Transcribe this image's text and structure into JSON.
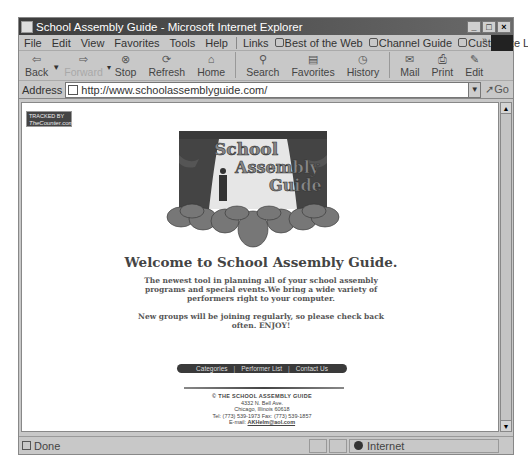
{
  "window": {
    "title": "School Assembly Guide - Microsoft Internet Explorer",
    "controls": [
      "_",
      "□",
      "×"
    ]
  },
  "menubar": {
    "items": [
      "File",
      "Edit",
      "View",
      "Favorites",
      "Tools",
      "Help"
    ],
    "links_label": "Links",
    "links": [
      "Best of the Web",
      "Channel Guide",
      "Customize Links"
    ]
  },
  "toolbar": {
    "buttons": [
      {
        "label": "Back",
        "icon": "⇦",
        "enabled": true
      },
      {
        "label": "Forward",
        "icon": "⇨",
        "enabled": false
      },
      {
        "label": "Stop",
        "icon": "⊗",
        "enabled": true
      },
      {
        "label": "Refresh",
        "icon": "⟳",
        "enabled": true
      },
      {
        "label": "Home",
        "icon": "⌂",
        "enabled": true
      },
      {
        "label": "Search",
        "icon": "⚲",
        "enabled": true
      },
      {
        "label": "Favorites",
        "icon": "▤",
        "enabled": true
      },
      {
        "label": "History",
        "icon": "◷",
        "enabled": true
      },
      {
        "label": "Mail",
        "icon": "✉",
        "enabled": true
      },
      {
        "label": "Print",
        "icon": "⎙",
        "enabled": true
      },
      {
        "label": "Edit",
        "icon": "✎",
        "enabled": true
      }
    ]
  },
  "address": {
    "label": "Address",
    "url": "http://www.schoolassemblyguide.com/",
    "go_label": "Go"
  },
  "page": {
    "tracked_badge": {
      "line1": "TRACKED BY",
      "line2": "TheCounter.com"
    },
    "logo": {
      "line1": "School",
      "line2": "Assembly",
      "line3": "Guide"
    },
    "welcome": "Welcome to School Assembly Guide.",
    "blurb": "The newest tool in planning all of your school assembly programs and special events.We bring a wide variety of performers right to your computer.",
    "blurb2": "New groups will be joining regularly, so please check back often. ENJOY!",
    "nav": [
      "Categories",
      "Performer List",
      "Contact Us"
    ],
    "nav_sep": "|",
    "footer": {
      "title": "© THE SCHOOL ASSEMBLY GUIDE",
      "address1": "4332 N. Bell Ave.",
      "address2": "Chicago, Illinois 60618",
      "phone": "Tel: (773) 539-1973 Fax: (773) 539-1857",
      "email_label": "E-mail:",
      "email": "AKHelm@aol.com"
    }
  },
  "statusbar": {
    "text": "Done",
    "zone": "Internet"
  },
  "colors": {
    "chrome": "#c8c8c8",
    "titlebar": "#3c3c3c",
    "nav_bar": "#3a3a3a",
    "heading_text": "#444444"
  }
}
